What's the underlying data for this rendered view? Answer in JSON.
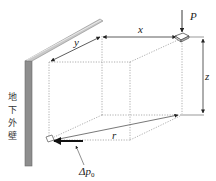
{
  "figure": {
    "wall_label_chars": [
      "地",
      "下",
      "外",
      "壁"
    ],
    "labels": {
      "load": "P",
      "x": "x",
      "y": "y",
      "z": "z",
      "r": "r",
      "delta_p_main": "Δp",
      "delta_p_sub": "0"
    },
    "colors": {
      "wall_fill": "#8e8e8e",
      "wall_edge": "#6a6a6a",
      "beam_fill": "#c9c9c9",
      "line": "#555555",
      "dotted": "#9a9a9a",
      "arrow": "#111111"
    }
  }
}
